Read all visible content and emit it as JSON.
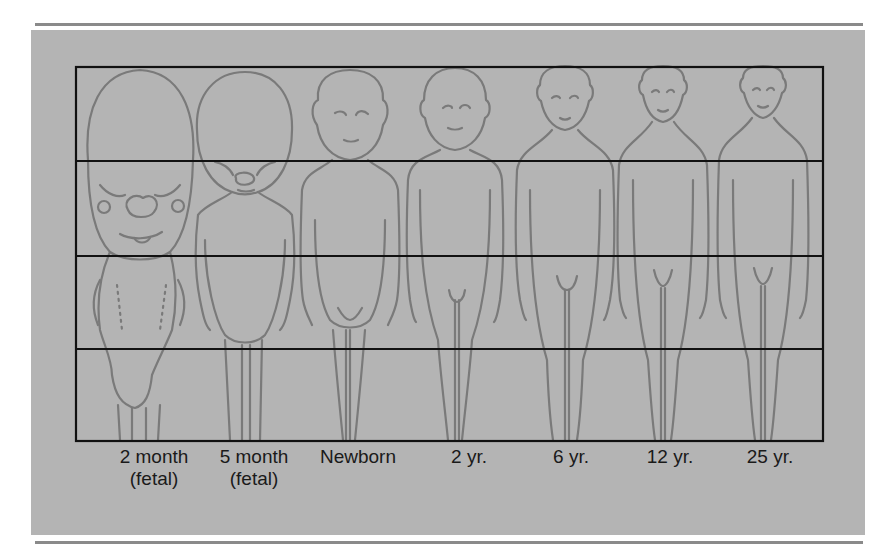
{
  "figure": {
    "type": "proportion-diagram",
    "colors": {
      "panel": "#b4b4b4",
      "grid": "#111111",
      "outline": "#7a7a7a",
      "rule": "#8a8a8a",
      "text": "#1a1a1a"
    },
    "grid": {
      "rows": 4,
      "columns_of_figures": 7
    },
    "stages": [
      {
        "label": "2 month",
        "sublabel": "(fetal)",
        "head_fraction": 0.5
      },
      {
        "label": "5 month",
        "sublabel": "(fetal)",
        "head_fraction": 0.33
      },
      {
        "label": "Newborn",
        "sublabel": "",
        "head_fraction": 0.25
      },
      {
        "label": "2 yr.",
        "sublabel": "",
        "head_fraction": 0.2
      },
      {
        "label": "6 yr.",
        "sublabel": "",
        "head_fraction": 0.17
      },
      {
        "label": "12 yr.",
        "sublabel": "",
        "head_fraction": 0.14
      },
      {
        "label": "25 yr.",
        "sublabel": "",
        "head_fraction": 0.125
      }
    ]
  }
}
